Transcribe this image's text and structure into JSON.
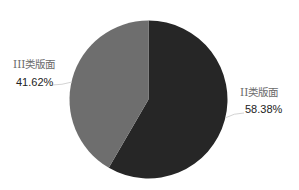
{
  "chart_data": {
    "type": "pie",
    "title": "",
    "categories": [
      "II类版面",
      "III类版面"
    ],
    "values": [
      58.38,
      41.62
    ],
    "labels": [
      {
        "name": "II类版面",
        "percent": "58.38%"
      },
      {
        "name": "III类版面",
        "percent": "41.62%"
      }
    ],
    "colors": [
      "#262626",
      "#6e6e6e"
    ],
    "start_angle": "12 o'clock",
    "direction": "clockwise",
    "legend": "none (inline labels)"
  }
}
